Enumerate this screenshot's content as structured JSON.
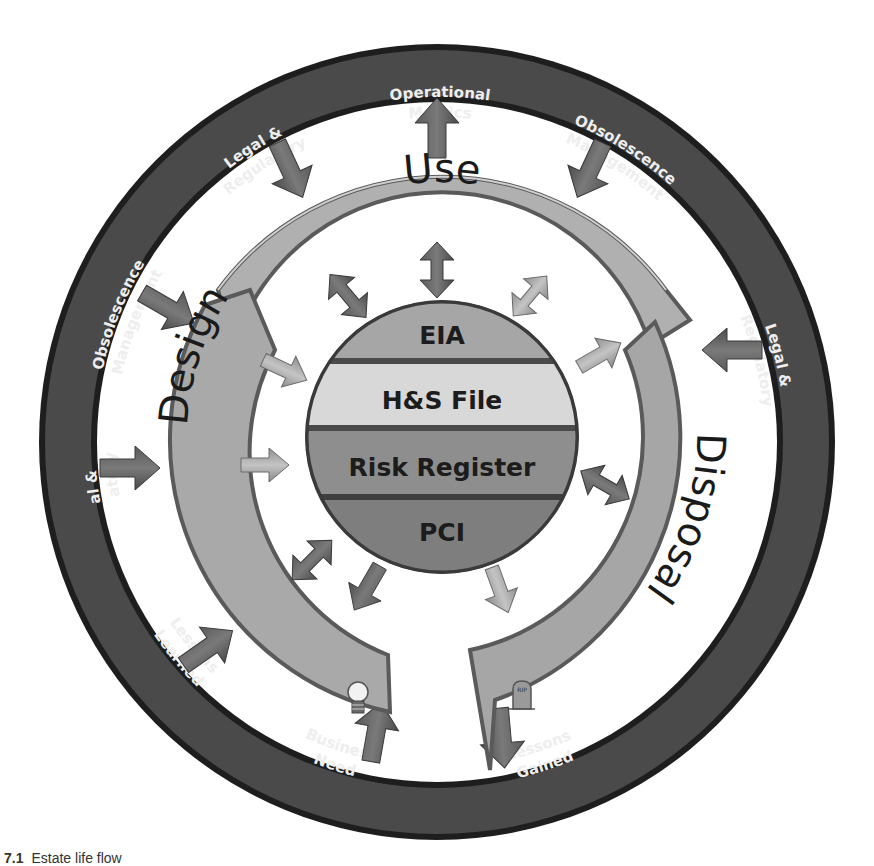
{
  "figure": {
    "caption_number": "7.1",
    "caption_text": "Estate life flow"
  },
  "outer_ring": {
    "color": "#4a4a4a",
    "border_color": "#1e1e1e",
    "labels": [
      {
        "id": "operational-metrics",
        "line1": "Operational",
        "line2": "Metrics",
        "arrow": "outward"
      },
      {
        "id": "obsolescence-management-top-right",
        "line1": "Obsolescence",
        "line2": "Management",
        "arrow": "inward"
      },
      {
        "id": "legal-regulatory-right",
        "line1": "Legal &",
        "line2": "Regulatory",
        "arrow": "inward"
      },
      {
        "id": "lessons-gained",
        "line1": "Lessons",
        "line2": "Gained",
        "arrow": "outward"
      },
      {
        "id": "business-need",
        "line1": "Business",
        "line2": "Need",
        "arrow": "inward"
      },
      {
        "id": "lessons-learned",
        "line1": "Lessons",
        "line2": "Learned",
        "arrow": "inward"
      },
      {
        "id": "legal-regulatory-left",
        "line1": "Legal &",
        "line2": "Regulatory",
        "arrow": "inward"
      },
      {
        "id": "obsolescence-management-left",
        "line1": "Obsolescence",
        "line2": "Management",
        "arrow": "inward"
      },
      {
        "id": "legal-regulatory-top-left",
        "line1": "Legal &",
        "line2": "Regulatory",
        "arrow": "inward"
      }
    ]
  },
  "lifecycle_ring": {
    "color": "#a9a9a9",
    "phases": [
      {
        "id": "design",
        "label": "Design",
        "icon": "lightbulb-icon"
      },
      {
        "id": "use",
        "label": "Use"
      },
      {
        "id": "disposal",
        "label": "Disposal",
        "icon": "gravestone-icon",
        "icon_text": "RIP"
      }
    ]
  },
  "core": {
    "layers": [
      {
        "label": "EIA",
        "color": "#a6a6a6"
      },
      {
        "label": "H&S File",
        "color": "#d6d6d6"
      },
      {
        "label": "Risk Register",
        "color": "#8c8c8c"
      },
      {
        "label": "PCI",
        "color": "#7d7d7d"
      }
    ]
  }
}
